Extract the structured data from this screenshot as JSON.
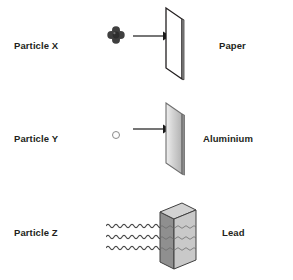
{
  "figure": {
    "background_color": "#ffffff",
    "width": 293,
    "height": 280
  },
  "rows": [
    {
      "id": "row-alpha",
      "particle_label": "Particle X",
      "barrier_label": "Paper",
      "particle_icon": "alpha-particle-cluster-icon",
      "beam_icon": "straight-arrow-icon",
      "barrier_icon": "paper-sheet-icon",
      "outcome": "blocked",
      "barrier_fill": "#ffffff",
      "barrier_stroke": "#231f20"
    },
    {
      "id": "row-beta",
      "particle_label": "Particle Y",
      "barrier_label": "Aluminium",
      "particle_icon": "beta-particle-dot-icon",
      "beam_icon": "straight-arrow-icon",
      "barrier_icon": "aluminium-sheet-icon",
      "outcome": "blocked",
      "barrier_fill": "#d9d9d9",
      "barrier_stroke": "#7f7f7f"
    },
    {
      "id": "row-gamma",
      "particle_label": "Particle Z",
      "barrier_label": "Lead",
      "particle_icon": "gamma-wave-icon",
      "beam_icon": "wavy-lines-icon",
      "barrier_icon": "lead-block-icon",
      "outcome": "penetrates",
      "barrier_fill": "#bfbfbf",
      "barrier_stroke": "#3f3f3f"
    }
  ],
  "colors": {
    "text": "#231f20",
    "alpha_particle": "#3a3a3a",
    "beta_particle_stroke": "#8a8a8a",
    "arrow": "#1a1a1a",
    "wave": "#4a4a4a",
    "lead_top": "#d0d0d0",
    "lead_front": "#c7c7c7",
    "lead_side": "#8f8f8f"
  }
}
